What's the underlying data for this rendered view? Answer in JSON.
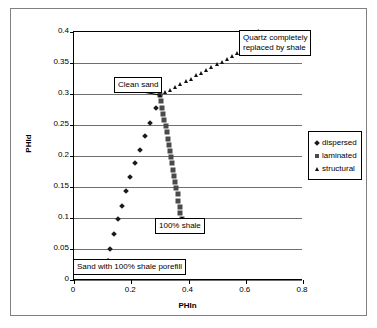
{
  "chart_data": {
    "type": "scatter",
    "title": "",
    "xlabel": "PHIn",
    "ylabel": "PHId",
    "xlim": [
      0,
      0.8
    ],
    "ylim": [
      0,
      0.4
    ],
    "x_ticks": [
      "0",
      "0.2",
      "0.4",
      "0.6",
      "0.8"
    ],
    "x_tick_values": [
      0,
      0.2,
      0.4,
      0.6,
      0.8
    ],
    "y_ticks": [
      "0",
      "0.05",
      "0.1",
      "0.15",
      "0.2",
      "0.25",
      "0.3",
      "0.35",
      "0.4"
    ],
    "y_tick_values": [
      0,
      0.05,
      0.1,
      0.15,
      0.2,
      0.25,
      0.3,
      0.35,
      0.4
    ],
    "grid": "horizontal",
    "legend_position": "right",
    "series": [
      {
        "name": "dispersed",
        "marker": "diamond",
        "color": "#1a1a1a",
        "points": [
          [
            0.12,
            0.03
          ],
          [
            0.126,
            0.05
          ],
          [
            0.139,
            0.075
          ],
          [
            0.152,
            0.098
          ],
          [
            0.166,
            0.12
          ],
          [
            0.181,
            0.143
          ],
          [
            0.196,
            0.166
          ],
          [
            0.212,
            0.188
          ],
          [
            0.229,
            0.21
          ],
          [
            0.247,
            0.232
          ],
          [
            0.266,
            0.254
          ],
          [
            0.285,
            0.277
          ],
          [
            0.3,
            0.298
          ]
        ]
      },
      {
        "name": "laminated",
        "marker": "square",
        "color": "#4a4a4a",
        "points": [
          [
            0.3,
            0.298
          ],
          [
            0.304,
            0.288
          ],
          [
            0.308,
            0.278
          ],
          [
            0.312,
            0.268
          ],
          [
            0.316,
            0.258
          ],
          [
            0.32,
            0.248
          ],
          [
            0.324,
            0.238
          ],
          [
            0.328,
            0.228
          ],
          [
            0.331,
            0.218
          ],
          [
            0.335,
            0.208
          ],
          [
            0.339,
            0.198
          ],
          [
            0.343,
            0.188
          ],
          [
            0.347,
            0.178
          ],
          [
            0.35,
            0.168
          ],
          [
            0.354,
            0.158
          ],
          [
            0.358,
            0.148
          ],
          [
            0.362,
            0.138
          ],
          [
            0.365,
            0.128
          ],
          [
            0.369,
            0.118
          ],
          [
            0.372,
            0.108
          ],
          [
            0.376,
            0.098
          ]
        ]
      },
      {
        "name": "structural",
        "marker": "triangle",
        "color": "#111111",
        "points": [
          [
            0.3,
            0.298
          ],
          [
            0.318,
            0.303
          ],
          [
            0.336,
            0.307
          ],
          [
            0.354,
            0.312
          ],
          [
            0.372,
            0.316
          ],
          [
            0.39,
            0.321
          ],
          [
            0.408,
            0.325
          ],
          [
            0.426,
            0.33
          ],
          [
            0.444,
            0.334
          ],
          [
            0.462,
            0.339
          ],
          [
            0.48,
            0.343
          ],
          [
            0.498,
            0.348
          ],
          [
            0.516,
            0.352
          ],
          [
            0.534,
            0.357
          ],
          [
            0.552,
            0.361
          ],
          [
            0.57,
            0.366
          ],
          [
            0.585,
            0.37
          ]
        ]
      }
    ],
    "annotations": [
      {
        "id": "quartz",
        "text": "Quartz completely\nreplaced by shale",
        "target_point": [
          0.585,
          0.37
        ]
      },
      {
        "id": "clean-sand",
        "text": "Clean sand",
        "target_point": [
          0.3,
          0.298
        ]
      },
      {
        "id": "shale-100",
        "text": "100% shale",
        "target_point": [
          0.376,
          0.098
        ]
      },
      {
        "id": "porefill",
        "text": "Sand with 100% shale porefill",
        "target_point": [
          0.12,
          0.03
        ]
      }
    ]
  },
  "legend": {
    "items": [
      {
        "label": "dispersed",
        "marker": "diamond"
      },
      {
        "label": "laminated",
        "marker": "square"
      },
      {
        "label": "structural",
        "marker": "triangle"
      }
    ]
  },
  "axes": {
    "x_title": "PHIn",
    "y_title": "PHId"
  }
}
